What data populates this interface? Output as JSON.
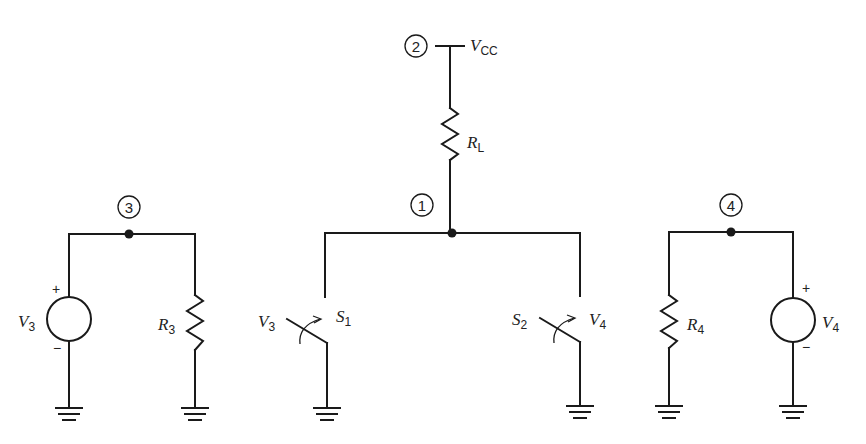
{
  "diagram": {
    "type": "circuit-schematic",
    "nodes": [
      {
        "id": "node-1",
        "label": "1"
      },
      {
        "id": "node-2",
        "label": "2"
      },
      {
        "id": "node-3",
        "label": "3"
      },
      {
        "id": "node-4",
        "label": "4"
      }
    ],
    "supply": {
      "main": "V",
      "sub": "CC"
    },
    "load_resistor": {
      "main": "R",
      "sub": "L"
    },
    "resistor_3": {
      "main": "R",
      "sub": "3"
    },
    "resistor_4": {
      "main": "R",
      "sub": "4"
    },
    "source_3": {
      "main": "V",
      "sub": "3",
      "plus": "+",
      "minus": "−"
    },
    "source_4": {
      "main": "V",
      "sub": "4",
      "plus": "+",
      "minus": "−"
    },
    "switch_1": {
      "main": "S",
      "sub": "1",
      "control_main": "V",
      "control_sub": "3"
    },
    "switch_2": {
      "main": "S",
      "sub": "2",
      "control_main": "V",
      "control_sub": "4"
    }
  }
}
